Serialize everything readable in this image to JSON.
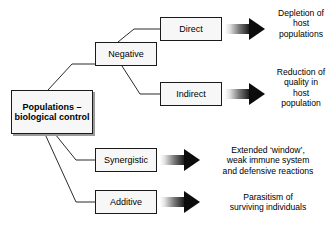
{
  "diagram": {
    "root": {
      "label_lines": [
        "Populations –",
        "biological",
        "control"
      ]
    },
    "categories": [
      {
        "id": "negative",
        "label": "Negative"
      },
      {
        "id": "direct",
        "label": "Direct"
      },
      {
        "id": "indirect",
        "label": "Indirect"
      },
      {
        "id": "synergistic",
        "label": "Synergistic"
      },
      {
        "id": "additive",
        "label": "Additive"
      }
    ],
    "outcomes": [
      {
        "id": "depletion",
        "from": "direct",
        "lines": [
          "Depletion of",
          "host",
          "populations"
        ]
      },
      {
        "id": "reduction",
        "from": "indirect",
        "lines": [
          "Reduction of",
          "quality in",
          "host",
          "population"
        ]
      },
      {
        "id": "extended-window",
        "from": "synergistic",
        "lines": [
          "Extended ‘window’,",
          "weak immune system",
          "and defensive reactions"
        ]
      },
      {
        "id": "parasitism",
        "from": "additive",
        "lines": [
          "Parasitism of",
          "surviving individuals"
        ]
      }
    ],
    "colors": {
      "background": "#ffffff",
      "box_border": "#1a1a1a",
      "box_fill": "#f7f7f7",
      "box_shadow": "#9a9a9a",
      "connector": "#2b2b2b",
      "arrow_tip": "#000000",
      "arrow_tail": "#ffffff",
      "text": "#000000"
    }
  }
}
